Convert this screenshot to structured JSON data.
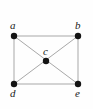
{
  "figure": {
    "type": "graph-diagram",
    "width": 93,
    "height": 109,
    "background_color": "#fefefe",
    "edge_color": "#a8a8a8",
    "vertex_color": "#141414",
    "label_color": "#1a1a1a"
  },
  "graph": {
    "vertices": [
      {
        "id": "a",
        "label": "a",
        "x": 14,
        "y": 36,
        "r": 3.2,
        "label_x": 10,
        "label_y": 20
      },
      {
        "id": "b",
        "label": "b",
        "x": 78,
        "y": 36,
        "r": 3.2,
        "label_x": 75,
        "label_y": 20
      },
      {
        "id": "c",
        "label": "c",
        "x": 46,
        "y": 61,
        "r": 3.2,
        "label_x": 43,
        "label_y": 46
      },
      {
        "id": "d",
        "label": "d",
        "x": 14,
        "y": 84,
        "r": 3.2,
        "label_x": 10,
        "label_y": 88
      },
      {
        "id": "e",
        "label": "e",
        "x": 78,
        "y": 84,
        "r": 3.2,
        "label_x": 75,
        "label_y": 88
      }
    ],
    "edges": [
      {
        "from": "a",
        "to": "b",
        "x1": 14,
        "y1": 36,
        "x2": 78,
        "y2": 36
      },
      {
        "from": "a",
        "to": "d",
        "x1": 14,
        "y1": 36,
        "x2": 14,
        "y2": 84
      },
      {
        "from": "b",
        "to": "e",
        "x1": 78,
        "y1": 36,
        "x2": 78,
        "y2": 84
      },
      {
        "from": "d",
        "to": "e",
        "x1": 14,
        "y1": 84,
        "x2": 78,
        "y2": 84
      },
      {
        "from": "a",
        "to": "e",
        "x1": 14,
        "y1": 36,
        "x2": 78,
        "y2": 84
      },
      {
        "from": "b",
        "to": "d",
        "x1": 78,
        "y1": 36,
        "x2": 14,
        "y2": 84
      }
    ]
  }
}
